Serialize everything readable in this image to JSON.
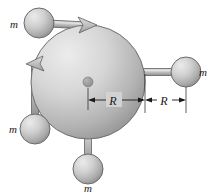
{
  "figure": {
    "background_color": "#ffffff",
    "width": 218,
    "height": 196,
    "disk": {
      "name": "central-disk",
      "center_x": 88,
      "center_y": 82,
      "radius": 57,
      "fill_light": "#e2e2e2",
      "fill_dark": "#9a9a9a",
      "edge_color": "#6f6f6f",
      "hub_radius": 5,
      "hub_color": "#8d8d8d"
    },
    "rod": {
      "color_light": "#d8d8d8",
      "color_dark": "#9d9d9d",
      "edge_color": "#5f5f5f",
      "thickness": 7,
      "length": 46,
      "pivot_color": "#2b2b2b",
      "pivot_radius": 1.6
    },
    "sphere": {
      "radius": 15,
      "fill_light": "#e8e8e8",
      "fill_dark": "#9b9b9b",
      "edge_color": "#6a6a6a"
    },
    "masses": [
      {
        "name": "mass-top-left",
        "label": "m",
        "angle_deg": 208,
        "label_x": 14,
        "label_y": 28,
        "sphere_cx": 39,
        "sphere_cy": 23,
        "anchor_x": 88,
        "anchor_y": 82
      },
      {
        "name": "mass-left",
        "label": "m",
        "angle_deg": 125,
        "label_x": 13,
        "label_y": 125,
        "sphere_cx": 35,
        "sphere_cy": 129,
        "anchor_x": 88,
        "anchor_y": 82
      },
      {
        "name": "mass-bottom",
        "label": "m",
        "angle_deg": 80,
        "label_x": 85,
        "label_y": 190,
        "sphere_cx": 88,
        "sphere_cy": 169,
        "anchor_x": 88,
        "anchor_y": 82
      },
      {
        "name": "mass-right",
        "label": "m",
        "angle_deg": 0,
        "label_x": 199,
        "label_y": 76,
        "sphere_cx": 186,
        "sphere_cy": 72,
        "anchor_x": 88,
        "anchor_y": 82
      }
    ],
    "arrows": [
      {
        "name": "disk-edge-arrow-top",
        "x": 91,
        "y": 23,
        "rotation_deg": -20
      },
      {
        "name": "disk-edge-arrow-left",
        "x": 28,
        "y": 62,
        "rotation_deg": 200
      }
    ],
    "dimensions": {
      "baseline_y": 105,
      "segments": [
        {
          "name": "dimension-inner-R",
          "label": "R",
          "x_start": 88,
          "x_end": 145,
          "label_x": 113,
          "label_y": 104
        },
        {
          "name": "dimension-outer-R",
          "label": "R",
          "x_start": 145,
          "x_end": 186,
          "label_x": 164,
          "label_y": 104
        }
      ],
      "extension_lines": [
        {
          "name": "extension-line-center",
          "x": 88,
          "y_top": 82,
          "y_bottom": 108
        },
        {
          "name": "extension-line-edge",
          "x": 145,
          "y_top": 74,
          "y_bottom": 112
        },
        {
          "name": "extension-line-sphere",
          "x": 186,
          "y_top": 72,
          "y_bottom": 112
        }
      ],
      "tick_color": "#1a1a1a"
    }
  }
}
